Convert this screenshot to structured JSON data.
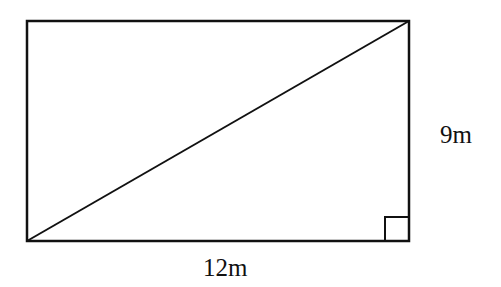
{
  "diagram": {
    "shape": "rectangle with diagonal",
    "labels": {
      "height": "9m",
      "width": "12m"
    },
    "right_angle_marker": "bottom-right",
    "stroke_color": "#111111"
  }
}
